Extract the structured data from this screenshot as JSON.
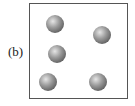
{
  "figure": {
    "label": "(b)",
    "balls": [
      {
        "x": 55,
        "y": 24
      },
      {
        "x": 102,
        "y": 35
      },
      {
        "x": 57,
        "y": 54
      },
      {
        "x": 48,
        "y": 82
      },
      {
        "x": 98,
        "y": 82
      }
    ],
    "ball_color": "#8a8a8a",
    "border_color": "#555555"
  }
}
